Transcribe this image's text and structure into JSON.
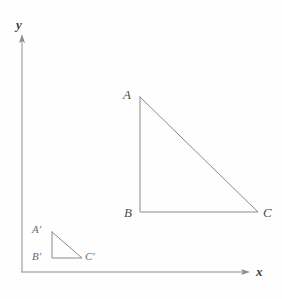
{
  "figure": {
    "background_color": "#fefefe",
    "line_color": "#8a8a8a",
    "label_color": "#4f4f4f"
  },
  "axes": {
    "x": {
      "label": "x",
      "label_x": 256,
      "label_y": 265,
      "start_x": 22,
      "start_y": 272,
      "end_x": 248,
      "end_y": 272,
      "arrow": "right"
    },
    "y": {
      "label": "y",
      "label_x": 16,
      "label_y": 18,
      "start_x": 22,
      "start_y": 272,
      "end_x": 22,
      "end_y": 36,
      "arrow": "up"
    }
  },
  "shapes": [
    {
      "name": "triangle-abc",
      "kind": "right-triangle",
      "vertices": [
        {
          "label": "A",
          "x": 140,
          "y": 97,
          "label_x": 123,
          "label_y": 88
        },
        {
          "label": "B",
          "x": 140,
          "y": 212,
          "label_x": 124,
          "label_y": 206
        },
        {
          "label": "C",
          "x": 258,
          "y": 212,
          "label_x": 263,
          "label_y": 206
        }
      ],
      "points_attr": "140,97 140,212 258,212 140,97",
      "leg_vertical": 115,
      "leg_horizontal": 118
    },
    {
      "name": "triangle-a-prime-b-prime-c-prime",
      "kind": "right-triangle",
      "vertices": [
        {
          "label": "A′",
          "x": 52,
          "y": 232,
          "label_x": 32,
          "label_y": 224
        },
        {
          "label": "B′",
          "x": 52,
          "y": 258,
          "label_x": 32,
          "label_y": 251
        },
        {
          "label": "C′",
          "x": 82,
          "y": 258,
          "label_x": 85,
          "label_y": 251
        }
      ],
      "points_attr": "52,232 52,258 82,258 52,232",
      "leg_vertical": 26,
      "leg_horizontal": 30
    }
  ]
}
